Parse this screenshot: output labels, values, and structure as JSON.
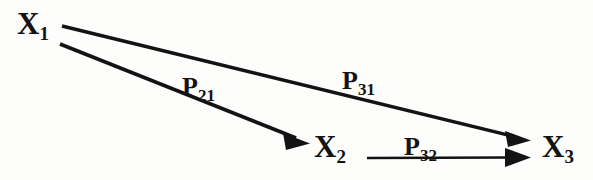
{
  "diagram": {
    "type": "path-diagram",
    "background_color": "#fdfdfc",
    "stroke_color": "#131313",
    "nodes": [
      {
        "id": "x1",
        "base": "X",
        "subscript": "1",
        "text": "X1",
        "x": 17,
        "y": 8
      },
      {
        "id": "x2",
        "base": "X",
        "subscript": "2",
        "text": "X2",
        "x": 314,
        "y": 131
      },
      {
        "id": "x3",
        "base": "X",
        "subscript": "3",
        "text": "X3",
        "x": 542,
        "y": 131
      }
    ],
    "paths": [
      {
        "id": "p21",
        "base": "P",
        "subscript": "21",
        "text": "P21",
        "from": "x1",
        "to": "x2",
        "label_x": 182,
        "label_y": 74,
        "start_x": 60,
        "start_y": 44,
        "end_x": 308,
        "end_y": 143
      },
      {
        "id": "p31",
        "base": "P",
        "subscript": "31",
        "text": "P31",
        "from": "x1",
        "to": "x3",
        "label_x": 342,
        "label_y": 68,
        "start_x": 62,
        "start_y": 26,
        "end_x": 530,
        "end_y": 140
      },
      {
        "id": "p32",
        "base": "P",
        "subscript": "32",
        "text": "P32",
        "from": "x2",
        "to": "x3",
        "label_x": 404,
        "label_y": 134,
        "start_x": 367,
        "start_y": 158,
        "end_x": 530,
        "end_y": 157
      }
    ]
  }
}
